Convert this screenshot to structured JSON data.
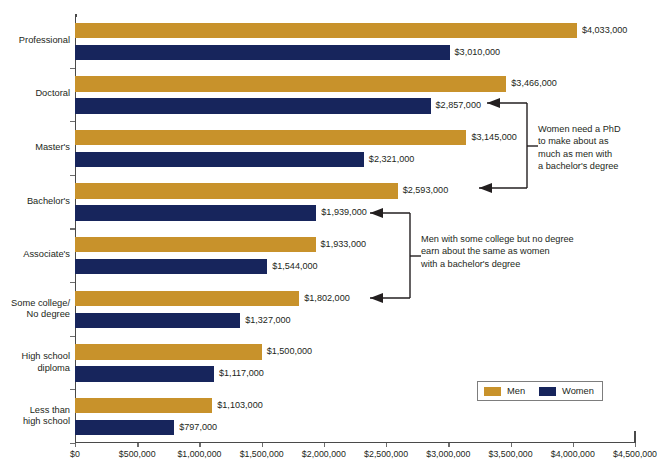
{
  "chart_data": {
    "type": "bar",
    "orientation": "horizontal",
    "title": "",
    "xlabel": "",
    "ylabel": "",
    "xlim": [
      0,
      4500000
    ],
    "xticks": [
      "$0",
      "$500,000",
      "$1,000,000",
      "$1,500,000",
      "$2,000,000",
      "$2,500,000",
      "$3,000,000",
      "$3,500,000",
      "$4,000,000",
      "$4,500,000"
    ],
    "xtick_values": [
      0,
      500000,
      1000000,
      1500000,
      2000000,
      2500000,
      3000000,
      3500000,
      4000000,
      4500000
    ],
    "grid": false,
    "legend_position": "bottom-right",
    "categories": [
      "Professional",
      "Doctoral",
      "Master's",
      "Bachelor's",
      "Associate's",
      "Some college/\nNo degree",
      "High school\ndiploma",
      "Less than\nhigh school"
    ],
    "series": [
      {
        "name": "Men",
        "color": "#c8922b",
        "values": [
          4033000,
          3466000,
          3145000,
          2593000,
          1933000,
          1802000,
          1500000,
          1103000
        ],
        "labels": [
          "$4,033,000",
          "$3,466,000",
          "$3,145,000",
          "$2,593,000",
          "$1,933,000",
          "$1,802,000",
          "$1,500,000",
          "$1,103,000"
        ]
      },
      {
        "name": "Women",
        "color": "#17255c",
        "values": [
          3010000,
          2857000,
          2321000,
          1939000,
          1544000,
          1327000,
          1117000,
          797000
        ],
        "labels": [
          "$3,010,000",
          "$2,857,000",
          "$2,321,000",
          "$1,939,000",
          "$1,544,000",
          "$1,327,000",
          "$1,117,000",
          "$797,000"
        ]
      }
    ],
    "annotations": [
      {
        "id": "phd-note",
        "text": "Women need a PhD\nto make about as\nmuch as men with\na bachelor's degree",
        "points_to": [
          "Doctoral / Women",
          "Bachelor's / Men"
        ]
      },
      {
        "id": "some-college-note",
        "text": "Men with some college but no degree\nearn about the same as women\nwith a bachelor's degree",
        "points_to": [
          "Bachelor's / Women",
          "Some college/No degree / Men"
        ]
      }
    ]
  },
  "legend": {
    "items": [
      {
        "label": "Men",
        "color": "#c8922b"
      },
      {
        "label": "Women",
        "color": "#17255c"
      }
    ]
  }
}
